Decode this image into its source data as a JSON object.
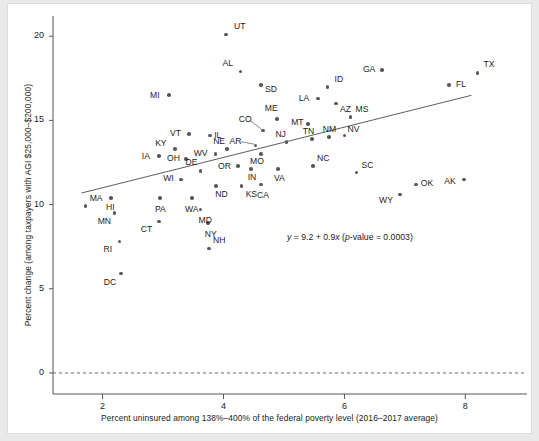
{
  "chart_data": {
    "type": "scatter",
    "title": "",
    "xlabel": "Percent uninsured among 138%–400% of the federal poverty level (2016–2017 average)",
    "ylabel": "Percent change (among taxpayers with AGI $25,000–$200,000)",
    "xlim": [
      1.18,
      8.92
    ],
    "ylim": [
      -1.25,
      21.2
    ],
    "xticks": [
      "2",
      "4",
      "6",
      "8"
    ],
    "xtickvals": [
      2,
      4,
      6,
      8
    ],
    "yticks": [
      "0",
      "5",
      "10",
      "15",
      "20"
    ],
    "ytickvals": [
      0,
      5,
      10,
      15,
      20
    ],
    "grid": false,
    "legend": null,
    "point_color": "#585858",
    "line_color": "#4a4a4a",
    "annotation": "y = 9.2 + 0.9x (p-value = 0.0003)",
    "annotation_parts": {
      "y": "y",
      "eq1": " = 9.2 + 0.9",
      "x": "x",
      "paren_open": " (",
      "p": "p",
      "eq2": "-value = 0.0003)"
    },
    "fit": {
      "intercept": 9.2,
      "slope": 0.9,
      "p_value": 0.0003,
      "x_start": 1.65,
      "x_end": 8.1
    },
    "reference_line": {
      "y": 0,
      "style": "dashed"
    },
    "points": [
      {
        "label": "UT",
        "x": 4.04,
        "y": 20.1,
        "lx": 8,
        "ly": -10
      },
      {
        "label": "AL",
        "x": 4.28,
        "y": 17.9,
        "lx": -18,
        "ly": -10
      },
      {
        "label": "SD",
        "x": 4.62,
        "y": 17.1,
        "lx": 4,
        "ly": 3
      },
      {
        "label": "ID",
        "x": 5.72,
        "y": 17.0,
        "lx": 7,
        "ly": -9
      },
      {
        "label": "GA",
        "x": 6.62,
        "y": 18.0,
        "lx": -19,
        "ly": -2
      },
      {
        "label": "TX",
        "x": 8.2,
        "y": 17.8,
        "lx": 6,
        "ly": -10
      },
      {
        "label": "FL",
        "x": 7.73,
        "y": 17.1,
        "lx": 7,
        "ly": -2
      },
      {
        "label": "LA",
        "x": 5.56,
        "y": 16.3,
        "lx": -19,
        "ly": -2
      },
      {
        "label": "AZ",
        "x": 5.86,
        "y": 16.0,
        "lx": 4,
        "ly": 4
      },
      {
        "label": "MS",
        "x": 6.1,
        "y": 15.2,
        "lx": 5,
        "ly": -9
      },
      {
        "label": "MI",
        "x": 3.1,
        "y": 16.5,
        "lx": -19,
        "ly": -1
      },
      {
        "label": "ME",
        "x": 4.88,
        "y": 15.1,
        "lx": -12,
        "ly": -12
      },
      {
        "label": "MT",
        "x": 5.4,
        "y": 14.8,
        "lx": -17,
        "ly": -3
      },
      {
        "label": "CO",
        "x": 4.65,
        "y": 14.4,
        "lx": -24,
        "ly": -12,
        "leader": true
      },
      {
        "label": "NV",
        "x": 6.0,
        "y": 14.1,
        "lx": 3,
        "ly": -8
      },
      {
        "label": "VT",
        "x": 3.43,
        "y": 14.2,
        "lx": -19,
        "ly": -2
      },
      {
        "label": "IL",
        "x": 3.78,
        "y": 14.1,
        "lx": 4,
        "ly": -2
      },
      {
        "label": "AR",
        "x": 4.53,
        "y": 13.5,
        "lx": -26,
        "ly": -6,
        "leader": true
      },
      {
        "label": "NJ",
        "x": 5.04,
        "y": 13.7,
        "lx": -11,
        "ly": -9
      },
      {
        "label": "TN",
        "x": 5.46,
        "y": 13.9,
        "lx": -9,
        "ly": -9
      },
      {
        "label": "NM",
        "x": 5.74,
        "y": 14.0,
        "lx": -6,
        "ly": -9
      },
      {
        "label": "KY",
        "x": 3.2,
        "y": 13.3,
        "lx": -20,
        "ly": -7
      },
      {
        "label": "NE",
        "x": 4.06,
        "y": 13.3,
        "lx": -14,
        "ly": -9
      },
      {
        "label": "WV",
        "x": 3.87,
        "y": 13.0,
        "lx": -22,
        "ly": -2
      },
      {
        "label": "OH",
        "x": 3.38,
        "y": 12.7,
        "lx": -19,
        "ly": -2
      },
      {
        "label": "IA",
        "x": 2.93,
        "y": 12.9,
        "lx": -17,
        "ly": -1
      },
      {
        "label": "MO",
        "x": 4.62,
        "y": 13.0,
        "lx": -11,
        "ly": 6
      },
      {
        "label": "OR",
        "x": 4.24,
        "y": 12.3,
        "lx": -20,
        "ly": -1
      },
      {
        "label": "IN",
        "x": 4.45,
        "y": 12.1,
        "lx": -3,
        "ly": 7
      },
      {
        "label": "VA",
        "x": 4.9,
        "y": 12.1,
        "lx": -4,
        "ly": 8
      },
      {
        "label": "NC",
        "x": 5.48,
        "y": 12.3,
        "lx": 4,
        "ly": -9
      },
      {
        "label": "SC",
        "x": 6.2,
        "y": 11.9,
        "lx": 5,
        "ly": -9
      },
      {
        "label": "DE",
        "x": 3.62,
        "y": 12.0,
        "lx": -15,
        "ly": -10
      },
      {
        "label": "WI",
        "x": 3.3,
        "y": 11.5,
        "lx": -18,
        "ly": -2
      },
      {
        "label": "ND",
        "x": 3.88,
        "y": 11.1,
        "lx": -1,
        "ly": 7
      },
      {
        "label": "KS",
        "x": 4.3,
        "y": 11.1,
        "lx": 4,
        "ly": 7
      },
      {
        "label": "CA",
        "x": 4.62,
        "y": 11.2,
        "lx": -4,
        "ly": 10
      },
      {
        "label": "MA",
        "x": 1.72,
        "y": 9.9,
        "lx": 4,
        "ly": -9
      },
      {
        "label": "HI",
        "x": 2.14,
        "y": 10.4,
        "lx": -5,
        "ly": 8
      },
      {
        "label": "PA",
        "x": 2.95,
        "y": 10.4,
        "lx": -5,
        "ly": 10
      },
      {
        "label": "WA",
        "x": 3.48,
        "y": 10.4,
        "lx": -7,
        "ly": 10
      },
      {
        "label": "MD",
        "x": 3.62,
        "y": 9.7,
        "lx": -2,
        "ly": 9
      },
      {
        "label": "MN",
        "x": 2.2,
        "y": 9.5,
        "lx": -17,
        "ly": 7
      },
      {
        "label": "NY",
        "x": 3.74,
        "y": 8.9,
        "lx": -3,
        "ly": 10
      },
      {
        "label": "CT",
        "x": 2.93,
        "y": 9.0,
        "lx": -18,
        "ly": 7
      },
      {
        "label": "RI",
        "x": 2.28,
        "y": 7.8,
        "lx": -16,
        "ly": 6
      },
      {
        "label": "NH",
        "x": 3.76,
        "y": 7.4,
        "lx": 4,
        "ly": -9
      },
      {
        "label": "DC",
        "x": 2.3,
        "y": 5.9,
        "lx": -17,
        "ly": 7
      },
      {
        "label": "WY",
        "x": 6.92,
        "y": 10.6,
        "lx": -21,
        "ly": 5
      },
      {
        "label": "OK",
        "x": 7.18,
        "y": 11.2,
        "lx": 5,
        "ly": -2
      },
      {
        "label": "AK",
        "x": 7.98,
        "y": 11.5,
        "lx": -20,
        "ly": 1
      }
    ]
  }
}
